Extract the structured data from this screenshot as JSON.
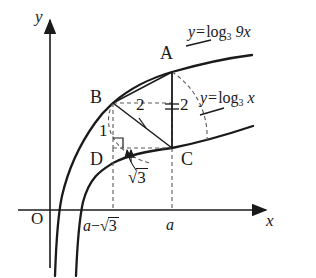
{
  "figure": {
    "type": "math-diagram",
    "background": "#ffffff",
    "stroke_color": "#1a1a1a",
    "dashed_color": "#555555",
    "width": 316,
    "height": 278
  },
  "axes": {
    "x_label": "x",
    "y_label": "y",
    "origin_label": "O",
    "origin_px": {
      "x": 50,
      "y": 210
    },
    "x_axis_end_px": {
      "x": 268,
      "y": 210
    },
    "y_axis_top_px": {
      "x": 50,
      "y": 18
    },
    "arrowheads": true,
    "x_ticks": [
      {
        "label": "a−√3",
        "x_px": 113
      },
      {
        "label": "a",
        "x_px": 172
      }
    ]
  },
  "curves": [
    {
      "name": "upper-curve",
      "equation_parts": {
        "lhs": "y",
        "eq": "=",
        "log": "log",
        "base": "3",
        "arg": "9x"
      },
      "equation_text": "y=log₃ 9x",
      "label_px": {
        "x": 188,
        "y": 26
      }
    },
    {
      "name": "lower-curve",
      "equation_parts": {
        "lhs": "y",
        "eq": "=",
        "log": "log",
        "base": "3",
        "arg": "x"
      },
      "equation_text": "y=log₃ x",
      "label_px": {
        "x": 200,
        "y": 92
      }
    }
  ],
  "points": [
    {
      "name": "A",
      "label": "A",
      "x_px": 172,
      "y_px": 72,
      "label_px": {
        "x": 160,
        "y": 44
      },
      "on_curve": "upper-curve"
    },
    {
      "name": "B",
      "label": "B",
      "x_px": 113,
      "y_px": 103,
      "label_px": {
        "x": 90,
        "y": 88
      },
      "on_curve": "upper-curve"
    },
    {
      "name": "C",
      "label": "C",
      "x_px": 172,
      "y_px": 148,
      "label_px": {
        "x": 181,
        "y": 150
      },
      "on_curve": "lower-curve"
    },
    {
      "name": "D",
      "label": "D",
      "x_px": 113,
      "y_px": 148,
      "label_px": {
        "x": 90,
        "y": 150
      },
      "on_curve": "none"
    }
  ],
  "measurements": [
    {
      "name": "segment-BD",
      "label": "1",
      "label_px": {
        "x": 99,
        "y": 122
      },
      "segment": "B-D"
    },
    {
      "name": "segment-BC",
      "label": "2",
      "label_px": {
        "x": 140,
        "y": 98
      },
      "segment": "B-C"
    },
    {
      "name": "segment-AC",
      "label": "2",
      "label_px": {
        "x": 176,
        "y": 98
      },
      "segment": "A-C",
      "equal_mark": "="
    },
    {
      "name": "segment-DC",
      "label": "√3",
      "label_px": {
        "x": 134,
        "y": 172
      },
      "segment": "D-C"
    }
  ],
  "annotations": {
    "right_angle_at": "D",
    "tick_mark_on": "segment-BC",
    "double_tick_on": "segment-AC",
    "leader_arrow_to": "segment-DC"
  }
}
